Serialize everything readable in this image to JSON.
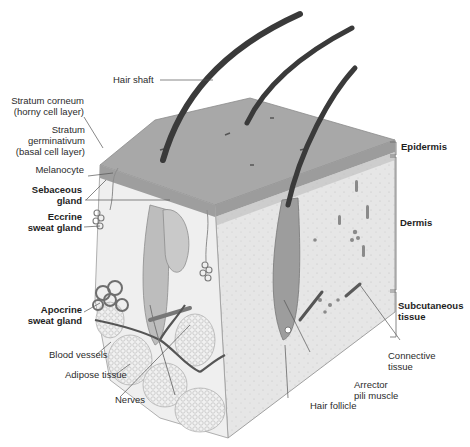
{
  "diagram": {
    "palette": {
      "background": "#ffffff",
      "epidermis_top": "#a9a9a9",
      "epidermis_edge": "#8f8f8f",
      "dermis": "#e4e4e4",
      "subcutaneous": "#efefef",
      "hair": "#3a3a3a",
      "leader_line": "#555555",
      "label_text": "#2b2b2b"
    },
    "left_labels": [
      {
        "id": "stratum-corneum",
        "lines": [
          "Stratum corneum",
          "(horny cell layer)"
        ],
        "bold": false
      },
      {
        "id": "stratum-germinativum",
        "lines": [
          "Stratum",
          "germinativum",
          "(basal cell layer)"
        ],
        "bold": false
      },
      {
        "id": "melanocyte",
        "lines": [
          "Melanocyte"
        ],
        "bold": false
      },
      {
        "id": "sebaceous-gland",
        "lines": [
          "Sebaceous",
          "gland"
        ],
        "bold": true
      },
      {
        "id": "eccrine-sweat-gland",
        "lines": [
          "Eccrine",
          "sweat gland"
        ],
        "bold": true
      },
      {
        "id": "apocrine-sweat-gland",
        "lines": [
          "Apocrine",
          "sweat gland"
        ],
        "bold": true
      },
      {
        "id": "blood-vessels",
        "lines": [
          "Blood vessels"
        ],
        "bold": false
      },
      {
        "id": "adipose-tissue",
        "lines": [
          "Adipose tissue"
        ],
        "bold": false
      },
      {
        "id": "nerves",
        "lines": [
          "Nerves"
        ],
        "bold": false
      }
    ],
    "top_labels": [
      {
        "id": "hair-shaft",
        "lines": [
          "Hair shaft"
        ],
        "bold": false
      }
    ],
    "right_labels": [
      {
        "id": "epidermis",
        "lines": [
          "Epidermis"
        ],
        "bold": true
      },
      {
        "id": "dermis",
        "lines": [
          "Dermis"
        ],
        "bold": true
      },
      {
        "id": "subcutaneous-tissue",
        "lines": [
          "Subcutaneous",
          "tissue"
        ],
        "bold": true
      }
    ],
    "bottom_labels": [
      {
        "id": "connective-tissue",
        "lines": [
          "Connective",
          "tissue"
        ],
        "bold": false
      },
      {
        "id": "arrector-pili-muscle",
        "lines": [
          "Arrector",
          "pili muscle"
        ],
        "bold": false
      },
      {
        "id": "hair-follicle",
        "lines": [
          "Hair follicle"
        ],
        "bold": false
      }
    ]
  }
}
